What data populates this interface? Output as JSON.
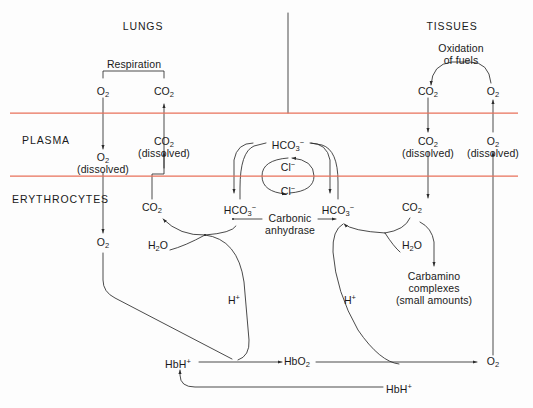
{
  "figure": {
    "width": 533,
    "height": 408,
    "membrane_color": "#e8705a",
    "line_color": "#2b2b2b",
    "text_color": "#1a1a1a"
  },
  "compartments": {
    "lungs": "LUNGS",
    "tissues": "TISSUES",
    "plasma": "PLASMA",
    "erythrocytes": "ERYTHROCYTES"
  },
  "processes": {
    "respiration": "Respiration",
    "oxidation_line1": "Oxidation",
    "oxidation_line2": "of fuels",
    "carbonic_line1": "Carbonic",
    "carbonic_line2": "anhydrase"
  },
  "species": {
    "o2": {
      "base": "O",
      "sub": "2"
    },
    "co2": {
      "base": "CO",
      "sub": "2"
    },
    "h2o": {
      "base": "H",
      "sub": "2",
      "tail": "O"
    },
    "hco3": {
      "base": "HCO",
      "sub": "3",
      "sup": "−"
    },
    "cl": {
      "base": "Cl",
      "sup": "−"
    },
    "h": {
      "base": "H",
      "sup": "+"
    },
    "hbh": {
      "base": "HbH",
      "sup": "+"
    },
    "hbo2": {
      "base": "HbO",
      "sub": "2"
    }
  },
  "labels": {
    "dissolved": "(dissolved)",
    "carbamino_line1": "Carbamino",
    "carbamino_line2": "complexes",
    "carbamino_line3": "(small amounts)"
  },
  "nodes": {
    "lungs_o2_alveolar": {
      "text": "O₂",
      "x": 103,
      "y": 92
    },
    "lungs_co2_alveolar": {
      "text": "CO₂",
      "x": 164,
      "y": 92
    },
    "plasma_o2_dissolved": {
      "text": "O₂",
      "x": 103,
      "y": 158
    },
    "plasma_co2_dissolved": {
      "text": "CO₂",
      "x": 164,
      "y": 142
    },
    "plasma_hco3_lung": {
      "text": "HCO₃⁻",
      "x": 288,
      "y": 143
    },
    "plasma_cl_upper": {
      "text": "Cl⁻",
      "x": 288,
      "y": 165
    },
    "plasma_cl_lower": {
      "text": "Cl⁻",
      "x": 288,
      "y": 189
    },
    "ery_co2_lung": {
      "text": "CO₂",
      "x": 152,
      "y": 208
    },
    "ery_hco3_lung": {
      "text": "HCO₃⁻",
      "x": 240,
      "y": 208
    },
    "ery_hco3_tissue": {
      "text": "HCO₃⁻",
      "x": 338,
      "y": 208
    },
    "ery_co2_tissue": {
      "text": "CO₂",
      "x": 412,
      "y": 208
    },
    "ery_h2o_lung": {
      "text": "H₂O",
      "x": 158,
      "y": 246
    },
    "ery_h2o_tissue": {
      "text": "H₂O",
      "x": 412,
      "y": 246
    },
    "ery_o2_lung": {
      "text": "O₂",
      "x": 103,
      "y": 243
    },
    "ery_h_lung": {
      "text": "H⁺",
      "x": 234,
      "y": 298
    },
    "ery_h_tissue": {
      "text": "H⁺",
      "x": 350,
      "y": 298
    },
    "hbh_left": {
      "text": "HbH⁺",
      "x": 178,
      "y": 362
    },
    "hbo2": {
      "text": "HbO₂",
      "x": 297,
      "y": 362
    },
    "hbh_right": {
      "text": "HbH⁺",
      "x": 399,
      "y": 387
    },
    "tissue_co2_alveolar": {
      "text": "CO₂",
      "x": 428,
      "y": 92
    },
    "tissue_o2_alveolar": {
      "text": "O₂",
      "x": 493,
      "y": 92
    },
    "tissue_co2_dissolved": {
      "text": "CO₂",
      "x": 428,
      "y": 142
    },
    "tissue_o2_dissolved": {
      "text": "O₂",
      "x": 493,
      "y": 142
    },
    "tissue_o2_bottom": {
      "text": "O₂",
      "x": 493,
      "y": 362
    }
  },
  "membranes": [
    {
      "name": "alveolar-plasma-boundary",
      "y": 113,
      "x1": 10,
      "x2": 518
    },
    {
      "name": "plasma-erythrocyte-boundary",
      "y": 176,
      "x1": 10,
      "x2": 518
    }
  ]
}
